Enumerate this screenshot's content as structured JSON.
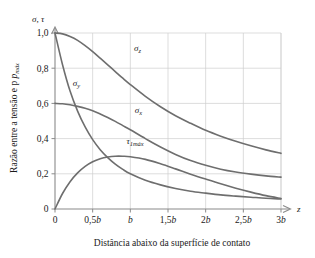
{
  "chart_data": {
    "type": "line",
    "title": "",
    "xlabel": "Distância abaixo da superfície de contato",
    "ylabel": "Razão entre a tensão e p",
    "ylabel_sub": "máx",
    "y_axis_symbol": "σ, τ",
    "x_axis_symbol": "z",
    "xlim": [
      0,
      3
    ],
    "ylim": [
      0,
      1.05
    ],
    "grid": true,
    "legend_position": "inline-annotations",
    "x_ticks": [
      0,
      0.5,
      1,
      1.5,
      2,
      2.5,
      3
    ],
    "x_tick_labels": [
      "0",
      "0,5b",
      "b",
      "1,5b",
      "2b",
      "2,5b",
      "3b"
    ],
    "y_ticks": [
      0,
      0.2,
      0.4,
      0.6,
      0.8,
      1.0
    ],
    "y_tick_labels": [
      "0",
      "0,2",
      "0,4",
      "0,6",
      "0,8",
      "1,0"
    ],
    "x": [
      0,
      0.1,
      0.2,
      0.3,
      0.4,
      0.5,
      0.6,
      0.7,
      0.8,
      0.9,
      1.0,
      1.2,
      1.4,
      1.6,
      1.8,
      2.0,
      2.2,
      2.4,
      2.6,
      2.8,
      3.0
    ],
    "series": [
      {
        "name": "sigma_z",
        "label": "σ",
        "label_sub": "z",
        "label_x": 1.05,
        "label_y": 0.9,
        "values": [
          1.0,
          0.995,
          0.98,
          0.958,
          0.928,
          0.894,
          0.857,
          0.819,
          0.781,
          0.743,
          0.707,
          0.64,
          0.581,
          0.53,
          0.487,
          0.447,
          0.414,
          0.385,
          0.359,
          0.336,
          0.316
        ]
      },
      {
        "name": "sigma_y",
        "label": "σ",
        "label_sub": "y",
        "label_x": 0.235,
        "label_y": 0.7,
        "values": [
          1.0,
          0.82,
          0.67,
          0.556,
          0.466,
          0.394,
          0.337,
          0.292,
          0.255,
          0.225,
          0.2,
          0.163,
          0.137,
          0.117,
          0.101,
          0.09,
          0.08,
          0.073,
          0.067,
          0.061,
          0.057
        ]
      },
      {
        "name": "sigma_x",
        "label": "σ",
        "label_sub": "x",
        "label_x": 1.06,
        "label_y": 0.545,
        "values": [
          0.6,
          0.598,
          0.592,
          0.583,
          0.572,
          0.558,
          0.54,
          0.52,
          0.498,
          0.474,
          0.45,
          0.4,
          0.352,
          0.31,
          0.275,
          0.248,
          0.226,
          0.21,
          0.198,
          0.188,
          0.181
        ]
      },
      {
        "name": "tau_1max",
        "label": "τ",
        "label_sub": "1máx",
        "label_x": 0.95,
        "label_y": 0.37,
        "values": [
          0.0,
          0.088,
          0.155,
          0.205,
          0.242,
          0.268,
          0.285,
          0.295,
          0.3,
          0.3,
          0.297,
          0.282,
          0.257,
          0.228,
          0.198,
          0.17,
          0.143,
          0.118,
          0.096,
          0.076,
          0.06
        ]
      }
    ],
    "colors": {
      "curve": "#6e6e6e",
      "axis": "#8a8a8a",
      "grid": "#cfcfcf",
      "text": "#1a1a1a",
      "background": "#ffffff"
    }
  }
}
